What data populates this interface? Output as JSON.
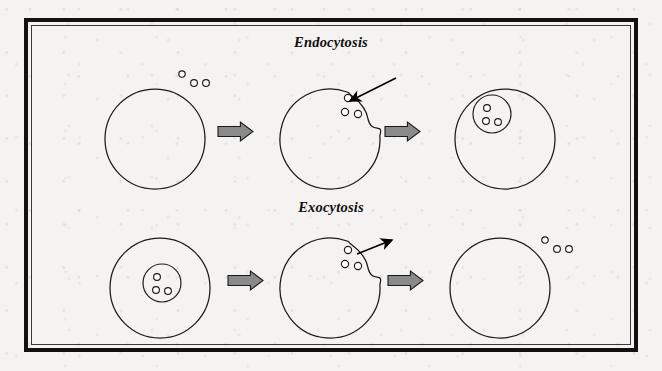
{
  "figure": {
    "background_color": "#f4f3f1",
    "frame_color": "#111111",
    "frame_inner_color": "#3a3a3a",
    "stroke_color": "#1a1a1a",
    "arrow_fill": "#8a8a8a",
    "arrow_stroke": "#1a1a1a",
    "pointer_arrow_color": "#000000",
    "particle_stroke": "#1a1a1a",
    "particle_fill": "#ffffff"
  },
  "rows": [
    {
      "id": "endocytosis",
      "title": "Endocytosis",
      "title_x": 331,
      "title_y": 34,
      "pointer_arrow": {
        "name": "inward-pointer-arrow",
        "direction": "inward",
        "from": [
          396,
          78
        ],
        "to": [
          350,
          101
        ]
      },
      "stages": [
        {
          "name": "cell-stage-1",
          "label": "intact cell with particles outside",
          "cell": {
            "cx": 155,
            "cy": 139,
            "r": 50,
            "shape": "circle"
          },
          "vesicle": null,
          "pocket": false,
          "particles": [
            {
              "cx": 182,
              "cy": 74,
              "r": 3.2
            },
            {
              "cx": 194,
              "cy": 83,
              "r": 3.4
            },
            {
              "cx": 206,
              "cy": 83,
              "r": 3.4
            }
          ]
        },
        {
          "name": "cell-stage-2",
          "label": "membrane invagination engulfing particles",
          "cell": {
            "cx": 330,
            "cy": 139,
            "r": 50,
            "shape": "pocket"
          },
          "vesicle": null,
          "pocket": true,
          "particles": [
            {
              "cx": 348,
              "cy": 98,
              "r": 3.6
            },
            {
              "cx": 345,
              "cy": 112,
              "r": 3.6
            },
            {
              "cx": 358,
              "cy": 114,
              "r": 3.6
            }
          ]
        },
        {
          "name": "cell-stage-3",
          "label": "internalized vesicle inside cell",
          "cell": {
            "cx": 505,
            "cy": 139,
            "r": 50,
            "shape": "circle"
          },
          "vesicle": {
            "cx": 492,
            "cy": 114,
            "r": 19
          },
          "pocket": false,
          "particles": [
            {
              "cx": 487,
              "cy": 108,
              "r": 3.4
            },
            {
              "cx": 486,
              "cy": 121,
              "r": 3.4
            },
            {
              "cx": 498,
              "cy": 122,
              "r": 3.4
            }
          ]
        }
      ],
      "block_arrows": [
        {
          "name": "process-arrow-1",
          "x": 218,
          "y": 122,
          "w": 35,
          "h": 19
        },
        {
          "name": "process-arrow-2",
          "x": 385,
          "y": 122,
          "w": 35,
          "h": 19
        }
      ]
    },
    {
      "id": "exocytosis",
      "title": "Exocytosis",
      "title_x": 331,
      "title_y": 199,
      "pointer_arrow": {
        "name": "outward-pointer-arrow",
        "direction": "outward",
        "from": [
          357,
          254
        ],
        "to": [
          392,
          240
        ]
      },
      "stages": [
        {
          "name": "cell-stage-1",
          "label": "cell containing secretory vesicle",
          "cell": {
            "cx": 160,
            "cy": 288,
            "r": 50,
            "shape": "circle"
          },
          "vesicle": {
            "cx": 162,
            "cy": 283,
            "r": 19
          },
          "pocket": false,
          "particles": [
            {
              "cx": 157,
              "cy": 277,
              "r": 3.4
            },
            {
              "cx": 156,
              "cy": 290,
              "r": 3.4
            },
            {
              "cx": 168,
              "cy": 291,
              "r": 3.4
            }
          ]
        },
        {
          "name": "cell-stage-2",
          "label": "vesicle fusing with membrane releasing contents",
          "cell": {
            "cx": 330,
            "cy": 288,
            "r": 50,
            "shape": "pocket"
          },
          "vesicle": null,
          "pocket": true,
          "particles": [
            {
              "cx": 348,
              "cy": 250,
              "r": 3.6
            },
            {
              "cx": 345,
              "cy": 264,
              "r": 3.6
            },
            {
              "cx": 358,
              "cy": 266,
              "r": 3.6
            }
          ]
        },
        {
          "name": "cell-stage-3",
          "label": "particles released outside cell",
          "cell": {
            "cx": 500,
            "cy": 288,
            "r": 50,
            "shape": "circle"
          },
          "vesicle": null,
          "pocket": false,
          "particles": [
            {
              "cx": 545,
              "cy": 240,
              "r": 3.2
            },
            {
              "cx": 557,
              "cy": 249,
              "r": 3.4
            },
            {
              "cx": 569,
              "cy": 249,
              "r": 3.4
            }
          ]
        }
      ],
      "block_arrows": [
        {
          "name": "process-arrow-1",
          "x": 228,
          "y": 271,
          "w": 35,
          "h": 19
        },
        {
          "name": "process-arrow-2",
          "x": 388,
          "y": 271,
          "w": 35,
          "h": 19
        }
      ]
    }
  ]
}
